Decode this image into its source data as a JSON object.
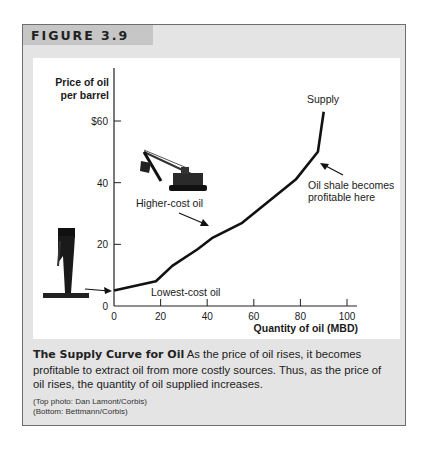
{
  "figure": {
    "label": "FIGURE 3.9",
    "caption_title": "The Supply Curve for Oil",
    "caption_text": " As the price of oil rises, it becomes profitable to extract oil from more costly sources. Thus, as the price of oil rises, the quantity of oil supplied increases.",
    "credit_top": "(Top photo: Dan Lamont/Corbis)",
    "credit_bottom": "(Bottom: Bettmann/Corbis)"
  },
  "chart_data": {
    "type": "line",
    "title": "",
    "xlabel": "Quantity of oil (MBD)",
    "ylabel_line1": "Price of oil",
    "ylabel_line2": "per barrel",
    "xlim": [
      0,
      100
    ],
    "ylim": [
      0,
      60
    ],
    "x_ticks": [
      0,
      20,
      40,
      60,
      80,
      100
    ],
    "x_tick_labels": [
      "0",
      "20",
      "40",
      "60",
      "80",
      "100"
    ],
    "y_ticks": [
      0,
      20,
      40,
      60
    ],
    "y_tick_labels": [
      "0",
      "20",
      "40",
      "$60"
    ],
    "grid": false,
    "series": [
      {
        "name": "Supply",
        "x": [
          0,
          18,
          25,
          36,
          42,
          55,
          78,
          87.5,
          90
        ],
        "y": [
          5,
          8,
          13,
          18.5,
          22,
          27,
          41,
          50,
          63
        ]
      }
    ],
    "annotations": [
      {
        "id": "supply",
        "text": "Supply"
      },
      {
        "id": "oil-shale-1",
        "text": "Oil shale becomes"
      },
      {
        "id": "oil-shale-2",
        "text": "profitable here"
      },
      {
        "id": "higher-cost",
        "text": "Higher-cost oil"
      },
      {
        "id": "lowest-cost",
        "text": "Lowest-cost oil"
      }
    ],
    "images": [
      "excavator-photo",
      "oil-gusher-photo"
    ]
  }
}
